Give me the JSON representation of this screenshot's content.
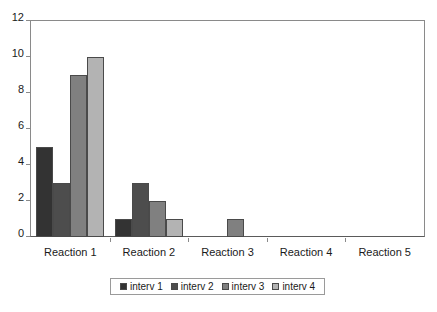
{
  "chart_data": {
    "type": "bar",
    "title": "",
    "subtitle": "",
    "xlabel": "",
    "ylabel": "",
    "categories": [
      "Reaction 1",
      "Reaction 2",
      "Reaction 3",
      "Reaction 4",
      "Reaction 5"
    ],
    "series": [
      {
        "name": "interv 1",
        "color": "#333333",
        "values": [
          5,
          1,
          0,
          0,
          0
        ]
      },
      {
        "name": "interv 2",
        "color": "#4d4d4d",
        "values": [
          3,
          3,
          0,
          0,
          0
        ]
      },
      {
        "name": "interv 3",
        "color": "#808080",
        "values": [
          9,
          2,
          1,
          0,
          0
        ]
      },
      {
        "name": "interv 4",
        "color": "#b3b3b3",
        "values": [
          10,
          1,
          0,
          0,
          0
        ]
      }
    ],
    "ylim": [
      0,
      12
    ],
    "yticks": [
      0,
      2,
      4,
      6,
      8,
      10,
      12
    ],
    "ytick_labels": [
      "0",
      "2",
      "4",
      "6",
      "8",
      "10",
      "12"
    ],
    "grid": false,
    "legend_position": "bottom-center",
    "grouping": "clustered",
    "bar_border_color": "#4a4a4a",
    "axis_color": "#8a8a8a",
    "background": "#ffffff"
  }
}
